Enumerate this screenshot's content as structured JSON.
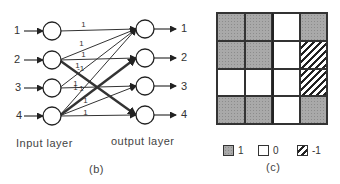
{
  "panel_b": {
    "caption": "(b)",
    "input_layer_label": "Input layer",
    "output_layer_label": "output layer",
    "input_labels": [
      "1",
      "2",
      "3",
      "4"
    ],
    "output_labels": [
      "1",
      "2",
      "3",
      "4"
    ],
    "connections": [
      {
        "from": 1,
        "to": 1,
        "weight": "1"
      },
      {
        "from": 2,
        "to": 1,
        "weight": "1"
      },
      {
        "from": 2,
        "to": 2,
        "weight": "1"
      },
      {
        "from": 2,
        "to": 4,
        "weight": "1",
        "bold": true
      },
      {
        "from": 3,
        "to": 1,
        "weight": "1"
      },
      {
        "from": 3,
        "to": 3,
        "weight": "1"
      },
      {
        "from": 4,
        "to": 1,
        "weight": "1"
      },
      {
        "from": 4,
        "to": 2,
        "weight": "1",
        "bold": true
      },
      {
        "from": 4,
        "to": 3,
        "weight": "1"
      },
      {
        "from": 4,
        "to": 4,
        "weight": "1"
      }
    ],
    "edge_labels": [
      "1",
      "1",
      "1",
      "-1",
      "1",
      "1",
      "1",
      "1",
      "1",
      "1"
    ]
  },
  "panel_c": {
    "caption": "(c)",
    "matrix": [
      [
        1,
        1,
        0,
        1
      ],
      [
        1,
        1,
        0,
        -1
      ],
      [
        0,
        0,
        0,
        -1
      ],
      [
        1,
        1,
        0,
        1
      ]
    ],
    "legend": [
      {
        "value": "1",
        "style": "shaded"
      },
      {
        "value": "0",
        "style": "white"
      },
      {
        "value": "-1",
        "style": "hatched"
      }
    ]
  }
}
